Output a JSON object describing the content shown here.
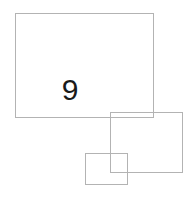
{
  "canvas": {
    "width": 194,
    "height": 199,
    "background_color": "#ffffff"
  },
  "style": {
    "stroke_color": "#b3b3b3",
    "stroke_width_px": 1,
    "label_color": "#1a1a1a"
  },
  "shapes": [
    {
      "name": "large-rectangle",
      "kind": "rectangle",
      "x": 15,
      "y": 13,
      "width": 139,
      "height": 105,
      "fill": "none",
      "stroke": "#b3b3b3"
    },
    {
      "name": "medium-rectangle",
      "kind": "rectangle",
      "x": 110,
      "y": 112,
      "width": 73,
      "height": 61,
      "fill": "none",
      "stroke": "#b3b3b3"
    },
    {
      "name": "small-rectangle",
      "kind": "rectangle",
      "x": 85,
      "y": 153,
      "width": 43,
      "height": 32,
      "fill": "none",
      "stroke": "#b3b3b3"
    }
  ],
  "labels": {
    "count_value": "9"
  }
}
